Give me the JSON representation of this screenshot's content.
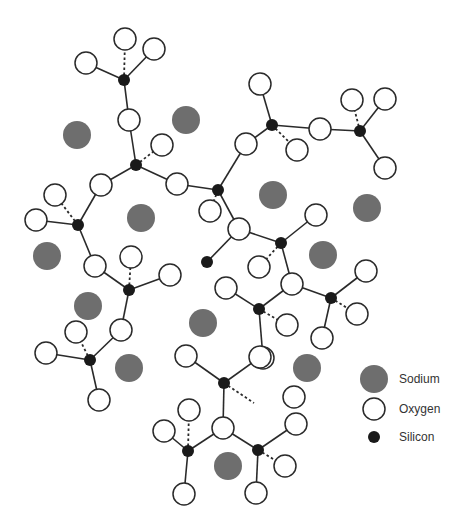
{
  "diagram": {
    "title": "",
    "colors": {
      "sodium": "#6e6e6e",
      "oxygen_fill": "#ffffff",
      "oxygen_stroke": "#2a2a2a",
      "silicon": "#1a1a1a",
      "bond": "#2a2a2a"
    },
    "radii": {
      "sodium": 14,
      "oxygen": 11,
      "silicon": 6
    },
    "sodium": [
      [
        77,
        135
      ],
      [
        186,
        120
      ],
      [
        141,
        218
      ],
      [
        47,
        256
      ],
      [
        273,
        195
      ],
      [
        367,
        208
      ],
      [
        88,
        306
      ],
      [
        203,
        323
      ],
      [
        323,
        255
      ],
      [
        129,
        368
      ],
      [
        307,
        368
      ],
      [
        228,
        466
      ]
    ],
    "silicon": [
      [
        124,
        80
      ],
      [
        136,
        165
      ],
      [
        78,
        225
      ],
      [
        218,
        190
      ],
      [
        272,
        125
      ],
      [
        360,
        131
      ],
      [
        129,
        290
      ],
      [
        90,
        360
      ],
      [
        281,
        243
      ],
      [
        259,
        309
      ],
      [
        331,
        298
      ],
      [
        224,
        383
      ],
      [
        188,
        451
      ],
      [
        258,
        450
      ],
      [
        207,
        262
      ]
    ],
    "oxygen": [
      [
        125,
        39
      ],
      [
        86,
        63
      ],
      [
        154,
        49
      ],
      [
        129,
        120
      ],
      [
        162,
        145
      ],
      [
        101,
        185
      ],
      [
        177,
        184
      ],
      [
        55,
        195
      ],
      [
        36,
        220
      ],
      [
        95,
        266
      ],
      [
        131,
        257
      ],
      [
        170,
        275
      ],
      [
        121,
        330
      ],
      [
        76,
        332
      ],
      [
        46,
        353
      ],
      [
        99,
        400
      ],
      [
        246,
        144
      ],
      [
        260,
        84
      ],
      [
        297,
        150
      ],
      [
        320,
        129
      ],
      [
        352,
        100
      ],
      [
        385,
        99
      ],
      [
        385,
        168
      ],
      [
        210,
        211
      ],
      [
        239,
        229
      ],
      [
        316,
        215
      ],
      [
        259,
        267
      ],
      [
        226,
        288
      ],
      [
        292,
        284
      ],
      [
        366,
        271
      ],
      [
        357,
        314
      ],
      [
        322,
        338
      ],
      [
        287,
        325
      ],
      [
        263,
        358
      ],
      [
        186,
        356
      ],
      [
        260,
        357
      ],
      [
        294,
        397
      ],
      [
        164,
        431
      ],
      [
        189,
        410
      ],
      [
        223,
        428
      ],
      [
        296,
        424
      ],
      [
        285,
        466
      ],
      [
        184,
        494
      ],
      [
        256,
        493
      ]
    ],
    "bonds": [
      {
        "a": [
          124,
          80
        ],
        "b": [
          86,
          63
        ]
      },
      {
        "a": [
          124,
          80
        ],
        "b": [
          154,
          49
        ]
      },
      {
        "a": [
          124,
          80
        ],
        "b": [
          125,
          39
        ],
        "dashed": true
      },
      {
        "a": [
          124,
          80
        ],
        "b": [
          129,
          120
        ]
      },
      {
        "a": [
          136,
          165
        ],
        "b": [
          129,
          120
        ]
      },
      {
        "a": [
          136,
          165
        ],
        "b": [
          162,
          145
        ],
        "dashed": true
      },
      {
        "a": [
          136,
          165
        ],
        "b": [
          101,
          185
        ]
      },
      {
        "a": [
          136,
          165
        ],
        "b": [
          177,
          184
        ]
      },
      {
        "a": [
          78,
          225
        ],
        "b": [
          101,
          185
        ]
      },
      {
        "a": [
          78,
          225
        ],
        "b": [
          36,
          220
        ]
      },
      {
        "a": [
          78,
          225
        ],
        "b": [
          55,
          195
        ],
        "dashed": true
      },
      {
        "a": [
          78,
          225
        ],
        "b": [
          95,
          266
        ]
      },
      {
        "a": [
          218,
          190
        ],
        "b": [
          177,
          184
        ]
      },
      {
        "a": [
          218,
          190
        ],
        "b": [
          246,
          144
        ]
      },
      {
        "a": [
          218,
          190
        ],
        "b": [
          210,
          211
        ],
        "dashed": true
      },
      {
        "a": [
          218,
          190
        ],
        "b": [
          239,
          229
        ]
      },
      {
        "a": [
          272,
          125
        ],
        "b": [
          246,
          144
        ]
      },
      {
        "a": [
          272,
          125
        ],
        "b": [
          260,
          84
        ]
      },
      {
        "a": [
          272,
          125
        ],
        "b": [
          297,
          150
        ],
        "dashed": true
      },
      {
        "a": [
          272,
          125
        ],
        "b": [
          320,
          129
        ]
      },
      {
        "a": [
          360,
          131
        ],
        "b": [
          320,
          129
        ]
      },
      {
        "a": [
          360,
          131
        ],
        "b": [
          352,
          100
        ],
        "dashed": true
      },
      {
        "a": [
          360,
          131
        ],
        "b": [
          385,
          99
        ]
      },
      {
        "a": [
          360,
          131
        ],
        "b": [
          385,
          168
        ]
      },
      {
        "a": [
          129,
          290
        ],
        "b": [
          95,
          266
        ]
      },
      {
        "a": [
          129,
          290
        ],
        "b": [
          131,
          257
        ],
        "dashed": true
      },
      {
        "a": [
          129,
          290
        ],
        "b": [
          170,
          275
        ]
      },
      {
        "a": [
          129,
          290
        ],
        "b": [
          121,
          330
        ]
      },
      {
        "a": [
          90,
          360
        ],
        "b": [
          121,
          330
        ]
      },
      {
        "a": [
          90,
          360
        ],
        "b": [
          76,
          332
        ],
        "dashed": true
      },
      {
        "a": [
          90,
          360
        ],
        "b": [
          46,
          353
        ]
      },
      {
        "a": [
          90,
          360
        ],
        "b": [
          99,
          400
        ]
      },
      {
        "a": [
          281,
          243
        ],
        "b": [
          239,
          229
        ]
      },
      {
        "a": [
          281,
          243
        ],
        "b": [
          316,
          215
        ]
      },
      {
        "a": [
          281,
          243
        ],
        "b": [
          259,
          267
        ],
        "dashed": true
      },
      {
        "a": [
          281,
          243
        ],
        "b": [
          292,
          284
        ]
      },
      {
        "a": [
          259,
          309
        ],
        "b": [
          226,
          288
        ]
      },
      {
        "a": [
          259,
          309
        ],
        "b": [
          292,
          284
        ]
      },
      {
        "a": [
          259,
          309
        ],
        "b": [
          287,
          325
        ],
        "dashed": true
      },
      {
        "a": [
          259,
          309
        ],
        "b": [
          263,
          358
        ]
      },
      {
        "a": [
          331,
          298
        ],
        "b": [
          292,
          284
        ]
      },
      {
        "a": [
          331,
          298
        ],
        "b": [
          366,
          271
        ]
      },
      {
        "a": [
          331,
          298
        ],
        "b": [
          357,
          314
        ],
        "dashed": true
      },
      {
        "a": [
          331,
          298
        ],
        "b": [
          322,
          338
        ]
      },
      {
        "a": [
          224,
          383
        ],
        "b": [
          186,
          356
        ]
      },
      {
        "a": [
          224,
          383
        ],
        "b": [
          260,
          357
        ]
      },
      {
        "a": [
          224,
          383
        ],
        "b": [
          254,
          403
        ],
        "dashed": true
      },
      {
        "a": [
          224,
          383
        ],
        "b": [
          223,
          428
        ]
      },
      {
        "a": [
          188,
          451
        ],
        "b": [
          164,
          431
        ]
      },
      {
        "a": [
          188,
          451
        ],
        "b": [
          189,
          410
        ],
        "dashed": true
      },
      {
        "a": [
          188,
          451
        ],
        "b": [
          223,
          428
        ]
      },
      {
        "a": [
          188,
          451
        ],
        "b": [
          184,
          494
        ]
      },
      {
        "a": [
          258,
          450
        ],
        "b": [
          223,
          428
        ]
      },
      {
        "a": [
          258,
          450
        ],
        "b": [
          296,
          424
        ]
      },
      {
        "a": [
          258,
          450
        ],
        "b": [
          285,
          466
        ],
        "dashed": true
      },
      {
        "a": [
          258,
          450
        ],
        "b": [
          256,
          493
        ]
      },
      {
        "a": [
          207,
          262
        ],
        "b": [
          239,
          229
        ]
      }
    ]
  },
  "legend": {
    "items": [
      {
        "label": "Sodium",
        "kind": "sodium",
        "x": 374,
        "y": 379
      },
      {
        "label": "Oxygen",
        "kind": "oxygen",
        "x": 374,
        "y": 409
      },
      {
        "label": "Silicon",
        "kind": "silicon",
        "x": 374,
        "y": 437
      }
    ]
  }
}
